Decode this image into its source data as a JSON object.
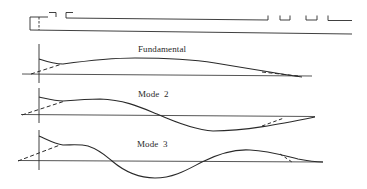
{
  "figure": {
    "beam_schematic": {
      "description": "cantilever beam with clamped root and stepped cross-section"
    },
    "modes": [
      {
        "label": "Fundamental"
      },
      {
        "label": "Mode  2"
      },
      {
        "label": "Mode  3"
      }
    ],
    "colors": {
      "line": "#2a2a2a",
      "axis": "#3a3a3a",
      "background": "#ffffff"
    }
  }
}
